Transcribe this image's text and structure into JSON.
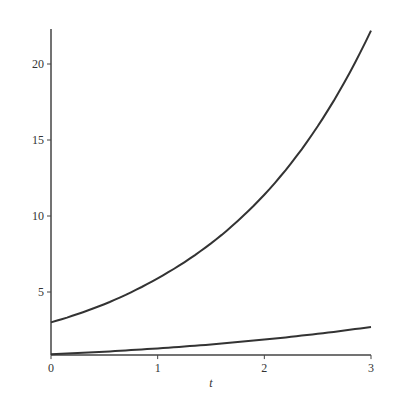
{
  "chart_data": {
    "type": "line",
    "title": "",
    "xlabel": "t",
    "ylabel": "",
    "xlim": [
      0,
      3
    ],
    "ylim": [
      0.85,
      22.3
    ],
    "grid": false,
    "legend": null,
    "x_ticks": [
      "0",
      "1",
      "2",
      "3"
    ],
    "y_ticks": [
      "5",
      "10",
      "15",
      "20"
    ],
    "x": [
      0,
      0.5,
      1,
      1.5,
      2,
      2.5,
      3
    ],
    "series": [
      {
        "name": "upper curve",
        "values": [
          3.0,
          4.2,
          5.9,
          8.2,
          11.4,
          15.9,
          22.2
        ]
      },
      {
        "name": "lower curve",
        "values": [
          0.9,
          1.07,
          1.29,
          1.55,
          1.87,
          2.25,
          2.7
        ]
      }
    ]
  }
}
